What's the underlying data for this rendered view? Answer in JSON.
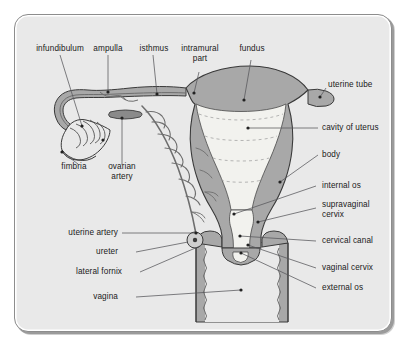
{
  "figure": {
    "frame": {
      "background_color": "#e9e9e9",
      "border_color": "#8d8d8d",
      "corner_radius_px": 14
    },
    "palette": {
      "panel_bg": "#e9e9e9",
      "myometrium_gray": "#a8a8a8",
      "cavity_pale": "#f2f2ee",
      "outline_dark": "#3a3a3a",
      "vessel_gray": "#8a8a8a",
      "leader_line": "#55555a",
      "text": "#1a1a1a"
    }
  },
  "labels": [
    {
      "id": "infundibulum",
      "text": "infundibulum",
      "align": "center"
    },
    {
      "id": "ampulla",
      "text": "ampulla",
      "align": "center"
    },
    {
      "id": "isthmus",
      "text": "isthmus",
      "align": "center"
    },
    {
      "id": "intramural-part-1",
      "text": "intramural",
      "align": "center"
    },
    {
      "id": "intramural-part-2",
      "text": "part",
      "align": "center"
    },
    {
      "id": "fundus",
      "text": "fundus",
      "align": "center"
    },
    {
      "id": "uterine-tube",
      "text": "uterine tube",
      "align": "left"
    },
    {
      "id": "cavity-of-uterus",
      "text": "cavity of uterus",
      "align": "left"
    },
    {
      "id": "body",
      "text": "body",
      "align": "left"
    },
    {
      "id": "internal-os",
      "text": "internal os",
      "align": "left"
    },
    {
      "id": "supravaginal-1",
      "text": "supravaginal",
      "align": "left"
    },
    {
      "id": "supravaginal-2",
      "text": "cervix",
      "align": "left"
    },
    {
      "id": "cervical-canal",
      "text": "cervical canal",
      "align": "left"
    },
    {
      "id": "vaginal-cervix",
      "text": "vaginal cervix",
      "align": "left"
    },
    {
      "id": "external-os",
      "text": "external os",
      "align": "left"
    },
    {
      "id": "fimbria",
      "text": "fimbria",
      "align": "center"
    },
    {
      "id": "ovarian-artery-1",
      "text": "ovarian",
      "align": "center"
    },
    {
      "id": "ovarian-artery-2",
      "text": "artery",
      "align": "center"
    },
    {
      "id": "uterine-artery",
      "text": "uterine artery",
      "align": "right"
    },
    {
      "id": "ureter",
      "text": "ureter",
      "align": "right"
    },
    {
      "id": "lateral-fornix",
      "text": "lateral fornix",
      "align": "right"
    },
    {
      "id": "vagina",
      "text": "vagina",
      "align": "right"
    }
  ]
}
